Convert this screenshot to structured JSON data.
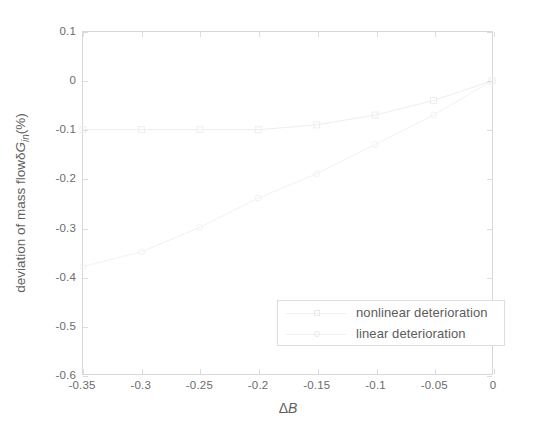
{
  "chart_data": {
    "type": "line",
    "title": "",
    "xlabel": "ΔB",
    "ylabel": "deviation of mass flowδG_in (%)",
    "xlim": [
      -0.35,
      0
    ],
    "ylim": [
      -0.6,
      0.1
    ],
    "grid": false,
    "legend_position": "lower right",
    "xticks": [
      "-0.35",
      "-0.3",
      "-0.25",
      "-0.2",
      "-0.15",
      "-0.1",
      "-0.05",
      "0"
    ],
    "xtick_values": [
      -0.35,
      -0.3,
      -0.25,
      -0.2,
      -0.15,
      -0.1,
      -0.05,
      0
    ],
    "yticks": [
      "0.1",
      "0",
      "-0.1",
      "-0.2",
      "-0.3",
      "-0.4",
      "-0.5",
      "-0.6"
    ],
    "ytick_values": [
      0.1,
      0,
      -0.1,
      -0.2,
      -0.3,
      -0.4,
      -0.5,
      -0.6
    ],
    "series": [
      {
        "name": "nonlinear deterioration",
        "marker": "square",
        "color": "#ededed",
        "x": [
          -0.35,
          -0.3,
          -0.25,
          -0.2,
          -0.15,
          -0.1,
          -0.05,
          0
        ],
        "values": [
          -0.1,
          -0.1,
          -0.1,
          -0.1,
          -0.09,
          -0.07,
          -0.04,
          0
        ]
      },
      {
        "name": "linear deterioration",
        "marker": "circle",
        "color": "#f1f1f1",
        "x": [
          -0.35,
          -0.3,
          -0.25,
          -0.2,
          -0.15,
          -0.1,
          -0.05,
          0
        ],
        "values": [
          -0.38,
          -0.35,
          -0.3,
          -0.24,
          -0.19,
          -0.13,
          -0.07,
          0
        ]
      }
    ]
  },
  "axes": {
    "xlabel_delta": "Δ",
    "xlabel_var": "B",
    "ylabel_prefix": "deviation of mass flowδ",
    "ylabel_var": "G",
    "ylabel_sub": "in",
    "ylabel_suffix": "(%)"
  },
  "legend": {
    "entries": [
      {
        "label": "nonlinear deterioration"
      },
      {
        "label": "linear deterioration"
      }
    ]
  }
}
